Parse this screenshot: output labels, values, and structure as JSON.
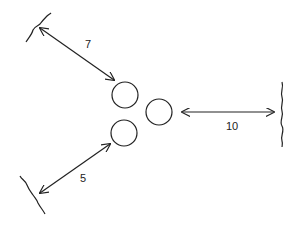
{
  "diagram": {
    "stroke_color": "#222222",
    "circles": [
      {
        "id": "top",
        "cx": 125,
        "cy": 95,
        "r": 13
      },
      {
        "id": "right",
        "cx": 159,
        "cy": 112,
        "r": 13
      },
      {
        "id": "bottom",
        "cx": 124,
        "cy": 133,
        "r": 13
      }
    ],
    "distances": [
      {
        "id": "top-left",
        "label": "7"
      },
      {
        "id": "right",
        "label": "10"
      },
      {
        "id": "bottom-left",
        "label": "5"
      }
    ]
  }
}
